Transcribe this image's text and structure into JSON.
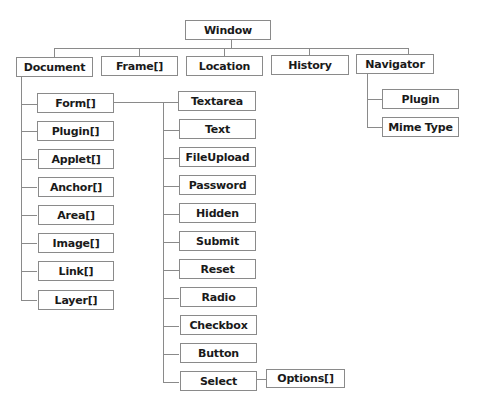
{
  "diagram": {
    "type": "tree",
    "root": "Window",
    "window_children": [
      "Document",
      "Frame[]",
      "Location",
      "History",
      "Navigator"
    ],
    "navigator_children": [
      "Plugin",
      "Mime Type"
    ],
    "document_children": [
      "Form[]",
      "Plugin[]",
      "Applet[]",
      "Anchor[]",
      "Area[]",
      "Image[]",
      "Link[]",
      "Layer[]"
    ],
    "form_children": [
      "Textarea",
      "Text",
      "FileUpload",
      "Password",
      "Hidden",
      "Submit",
      "Reset",
      "Radio",
      "Checkbox",
      "Button",
      "Select"
    ],
    "select_children": [
      "Options[]"
    ]
  },
  "colors": {
    "line": "#8a8a8a",
    "text": "#1a1a1a",
    "background": "#ffffff"
  }
}
